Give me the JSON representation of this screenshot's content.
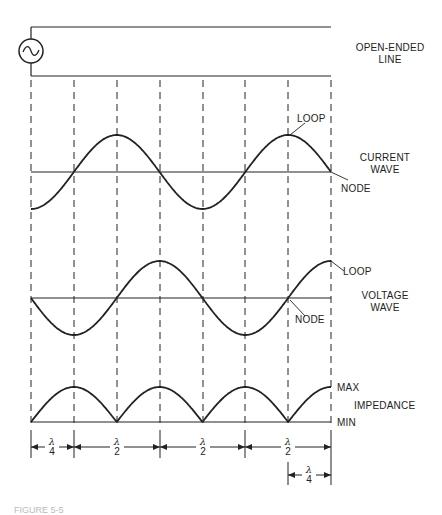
{
  "figure": {
    "line_label": "OPEN-ENDED LINE",
    "line_label_lines": [
      "OPEN-ENDED",
      "LINE"
    ],
    "source_symbol": "ac-source-icon",
    "current": {
      "title_lines": [
        "CURRENT",
        "WAVE"
      ],
      "loop_label": "LOOP",
      "node_label": "NODE"
    },
    "voltage": {
      "title_lines": [
        "VOLTAGE",
        "WAVE"
      ],
      "loop_label": "LOOP",
      "node_label": "NODE"
    },
    "impedance": {
      "title": "IMPEDANCE",
      "max_label": "MAX",
      "min_label": "MIN"
    },
    "dimensions": [
      {
        "num": "λ",
        "den": "4"
      },
      {
        "num": "λ",
        "den": "2"
      },
      {
        "num": "λ",
        "den": "2"
      },
      {
        "num": "λ",
        "den": "2"
      },
      {
        "num": "λ",
        "den": "4"
      }
    ],
    "caption": "FIGURE 5-5"
  },
  "colors": {
    "ink": "#222222",
    "background": "#ffffff"
  }
}
